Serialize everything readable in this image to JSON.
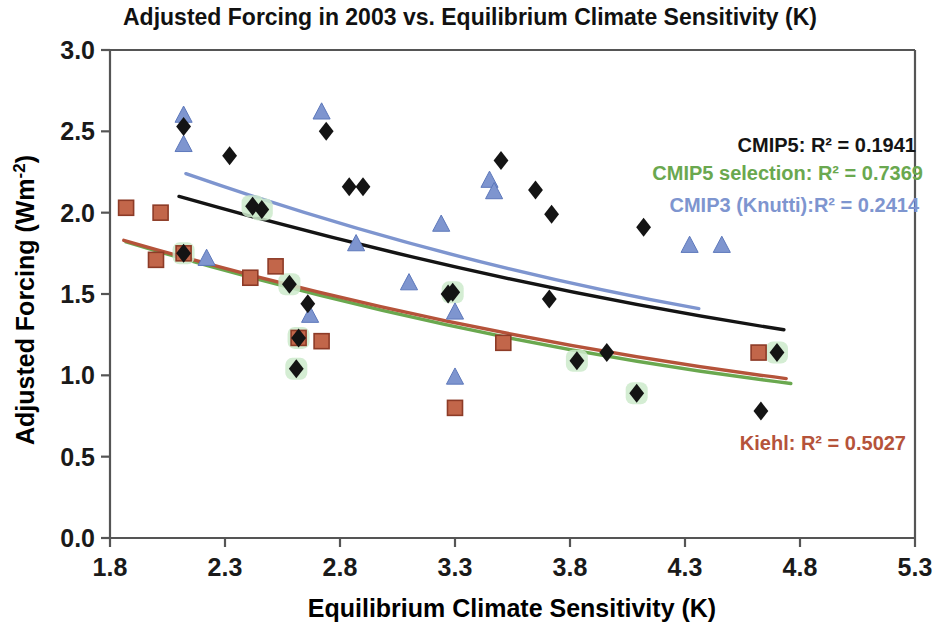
{
  "chart_data": {
    "type": "scatter",
    "title": "Adjusted Forcing  in 2003 vs. Equilibrium Climate Sensitivity (K)",
    "xlabel": "Equilibrium Climate Sensitivity (K)",
    "ylabel": "Adjusted Forcing (Wm-2)",
    "ylabel_display": "Adjusted Forcing (Wm",
    "ylabel_sup": "-2",
    "ylabel_close": ")",
    "xlim": [
      1.8,
      5.3
    ],
    "ylim": [
      0.0,
      3.0
    ],
    "xticks": [
      "1.8",
      "2.3",
      "2.8",
      "3.3",
      "3.8",
      "4.3",
      "4.8",
      "5.3"
    ],
    "xtick_values": [
      1.8,
      2.3,
      2.8,
      3.3,
      3.8,
      4.3,
      4.8,
      5.3
    ],
    "yticks": [
      "0.0",
      "0.5",
      "1.0",
      "1.5",
      "2.0",
      "2.5",
      "3.0"
    ],
    "ytick_values": [
      0.0,
      0.5,
      1.0,
      1.5,
      2.0,
      2.5,
      3.0
    ],
    "grid": false,
    "legend_position": "upper-right-inside",
    "colors": {
      "cmip5": "#141414",
      "cmip5_selection": "#6aa84f",
      "cmip3": "#7e95cf",
      "kiehl": "#b5533a",
      "selection_halo": "#cdeacb",
      "axis": "#555555"
    },
    "series": [
      {
        "name": "CMIP5",
        "marker": "diamond",
        "color": "#141414",
        "points": [
          [
            2.12,
            2.53
          ],
          [
            2.32,
            2.35
          ],
          [
            2.42,
            2.04
          ],
          [
            2.46,
            2.02
          ],
          [
            2.74,
            2.5
          ],
          [
            2.84,
            2.16
          ],
          [
            2.9,
            2.16
          ],
          [
            3.27,
            1.5
          ],
          [
            3.5,
            2.32
          ],
          [
            3.65,
            2.14
          ],
          [
            3.72,
            1.99
          ],
          [
            3.71,
            1.47
          ],
          [
            3.83,
            1.09
          ],
          [
            3.96,
            1.14
          ],
          [
            4.12,
            1.91
          ],
          [
            4.09,
            0.89
          ],
          [
            4.63,
            0.78
          ],
          [
            2.12,
            1.75
          ],
          [
            2.58,
            1.56
          ],
          [
            2.66,
            1.44
          ],
          [
            2.62,
            1.23
          ],
          [
            2.61,
            1.04
          ],
          [
            3.29,
            1.51
          ],
          [
            4.7,
            1.14
          ]
        ]
      },
      {
        "name": "CMIP5 selection",
        "marker": "diamond-highlighted",
        "color": "#141414",
        "halo": "#cdeacb",
        "points": [
          [
            2.42,
            2.04
          ],
          [
            2.46,
            2.02
          ],
          [
            2.12,
            1.75
          ],
          [
            2.58,
            1.56
          ],
          [
            2.62,
            1.23
          ],
          [
            2.61,
            1.04
          ],
          [
            3.83,
            1.09
          ],
          [
            4.7,
            1.14
          ],
          [
            4.09,
            0.89
          ],
          [
            3.29,
            1.51
          ]
        ]
      },
      {
        "name": "CMIP3 (Knutti)",
        "marker": "triangle",
        "color": "#7e95cf",
        "points": [
          [
            2.12,
            2.6
          ],
          [
            2.12,
            2.42
          ],
          [
            2.72,
            2.62
          ],
          [
            2.22,
            1.72
          ],
          [
            2.67,
            1.37
          ],
          [
            2.87,
            1.81
          ],
          [
            3.1,
            1.57
          ],
          [
            3.24,
            1.93
          ],
          [
            3.3,
            1.39
          ],
          [
            3.45,
            2.2
          ],
          [
            3.47,
            2.13
          ],
          [
            3.3,
            0.99
          ],
          [
            4.32,
            1.8
          ],
          [
            4.46,
            1.8
          ]
        ]
      },
      {
        "name": "Kiehl",
        "marker": "square",
        "color": "#b5533a",
        "points": [
          [
            1.87,
            2.03
          ],
          [
            2.02,
            2.0
          ],
          [
            2.0,
            1.71
          ],
          [
            2.12,
            1.75
          ],
          [
            2.41,
            1.6
          ],
          [
            2.52,
            1.67
          ],
          [
            2.62,
            1.23
          ],
          [
            2.72,
            1.21
          ],
          [
            3.3,
            0.8
          ],
          [
            3.51,
            1.2
          ],
          [
            4.62,
            1.14
          ]
        ]
      }
    ],
    "trend_lines": [
      {
        "name": "CMIP5 fit",
        "color": "#141414",
        "x_start": 2.1,
        "y_start": 2.1,
        "x_end": 4.73,
        "y_end": 1.28,
        "curvature": 0.09
      },
      {
        "name": "CMIP5 selection fit",
        "color": "#6aa84f",
        "x_start": 1.87,
        "y_start": 1.82,
        "x_end": 4.76,
        "y_end": 0.95,
        "curvature": 0.13
      },
      {
        "name": "CMIP3 fit",
        "color": "#7e95cf",
        "x_start": 2.13,
        "y_start": 2.24,
        "x_end": 4.36,
        "y_end": 1.41,
        "curvature": 0.1
      },
      {
        "name": "Kiehl fit",
        "color": "#b5533a",
        "x_start": 1.86,
        "y_start": 1.83,
        "x_end": 4.74,
        "y_end": 0.98,
        "curvature": 0.12
      }
    ]
  },
  "legend": {
    "cmip5": "CMIP5: R² = 0.1941",
    "cmip5_selection": "CMIP5 selection: R² = 0.7369",
    "cmip3": "CMIP3 (Knutti):R² = 0.2414",
    "kiehl": "Kiehl: R² = 0.5027"
  }
}
